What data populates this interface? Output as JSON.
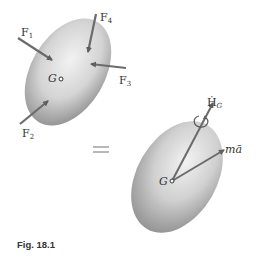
{
  "figure": {
    "caption": "Fig. 18.1",
    "left_body": {
      "center_label": "G",
      "forces": [
        {
          "name": "F",
          "sub": "1"
        },
        {
          "name": "F",
          "sub": "2"
        },
        {
          "name": "F",
          "sub": "3"
        },
        {
          "name": "F",
          "sub": "4"
        }
      ]
    },
    "right_body": {
      "center_label": "G",
      "angular_momentum_rate": {
        "name": "Ḣ",
        "sub": "G"
      },
      "inertia_vector": "mā"
    },
    "equals_sign": "="
  },
  "colors": {
    "arrow": "#6b6b6b",
    "body_light": "#f0f0f0",
    "body_dark": "#8a8a8a",
    "text": "#333333"
  }
}
